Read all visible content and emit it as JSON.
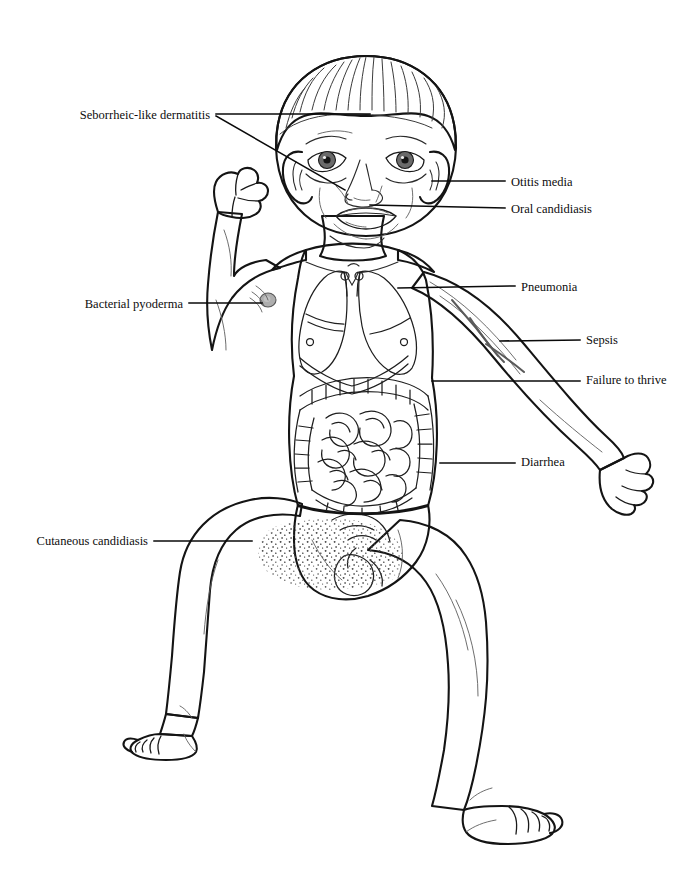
{
  "figure": {
    "background_color": "#ffffff",
    "skin_fill": "#9a9a9a",
    "skin_fill_light": "#a8a8a8",
    "skin_fill_dark": "#8b8b8b",
    "hair_fill": "#8e8e8e",
    "organ_fill": "#a3a3a3",
    "outline_color": "#141414",
    "label_color": "#0d0d0d",
    "leader_color": "#0a0a0a"
  },
  "labels": [
    {
      "id": "seborrheic-like-dermatitis",
      "text": "Seborrheic-like dermatitis",
      "side": "left",
      "text_x": 210,
      "text_y": 119,
      "leader": [
        [
          [
            216,
            114
          ],
          [
            370,
            114
          ]
        ],
        [
          [
            216,
            116
          ],
          [
            345,
            190
          ]
        ]
      ]
    },
    {
      "id": "otitis-media",
      "text": "Otitis media",
      "side": "right",
      "text_x": 511,
      "text_y": 186,
      "leader": [
        [
          [
            432,
            181
          ],
          [
            505,
            181
          ]
        ]
      ]
    },
    {
      "id": "oral-candidiasis",
      "text": "Oral candidiasis",
      "side": "right",
      "text_x": 511,
      "text_y": 213,
      "leader": [
        [
          [
            370,
            205
          ],
          [
            505,
            208
          ]
        ]
      ]
    },
    {
      "id": "bacterial-pyoderma",
      "text": "Bacterial pyoderma",
      "side": "left",
      "text_x": 183,
      "text_y": 308,
      "leader": [
        [
          [
            189,
            303
          ],
          [
            262,
            303
          ]
        ]
      ]
    },
    {
      "id": "pneumonia",
      "text": "Pneumonia",
      "side": "right",
      "text_x": 521,
      "text_y": 291,
      "leader": [
        [
          [
            398,
            288
          ],
          [
            515,
            286
          ]
        ]
      ]
    },
    {
      "id": "sepsis",
      "text": "Sepsis",
      "side": "right",
      "text_x": 586,
      "text_y": 344,
      "leader": [
        [
          [
            500,
            341
          ],
          [
            580,
            340
          ]
        ]
      ]
    },
    {
      "id": "failure-to-thrive",
      "text": "Failure to thrive",
      "side": "right",
      "text_x": 586,
      "text_y": 384,
      "leader": [
        [
          [
            432,
            381
          ],
          [
            580,
            381
          ]
        ]
      ]
    },
    {
      "id": "diarrhea",
      "text": "Diarrhea",
      "side": "right",
      "text_x": 521,
      "text_y": 466,
      "leader": [
        [
          [
            440,
            463
          ],
          [
            515,
            463
          ]
        ]
      ]
    },
    {
      "id": "cutaneous-candidiasis",
      "text": "Cutaneous candidiasis",
      "side": "left",
      "text_x": 148,
      "text_y": 545,
      "leader": [
        [
          [
            154,
            541
          ],
          [
            252,
            541
          ]
        ]
      ]
    }
  ],
  "anatomy_parts": [
    "head",
    "hair",
    "left-ear",
    "right-ear",
    "left-eye",
    "right-eye",
    "nose",
    "mouth",
    "neck",
    "torso",
    "left-arm-raised",
    "left-hand-clenched",
    "right-arm-extended",
    "right-hand",
    "lungs",
    "diaphragm",
    "large-intestine",
    "small-intestine",
    "diaper-area",
    "left-thigh",
    "left-lower-leg",
    "left-foot",
    "right-thigh",
    "right-lower-leg",
    "right-foot",
    "candidiasis-rash-stipple"
  ]
}
